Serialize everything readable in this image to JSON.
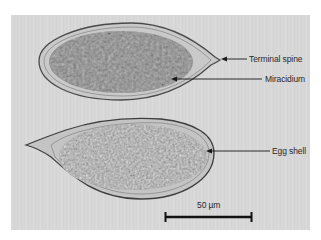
{
  "figure": {
    "annotations": [
      {
        "id": "terminal_spine",
        "label": "Terminal spine"
      },
      {
        "id": "miracidium",
        "label": "Miracidium"
      },
      {
        "id": "egg_shell",
        "label": "Egg shell"
      }
    ],
    "scale_bar": {
      "label": "50 µm"
    },
    "colors": {
      "background": "#d8d8d8",
      "top_egg_interior": "#8f8f8f",
      "bottom_egg_interior": "#a6a6a6",
      "shell_outline": "#4a4a4a",
      "annotation": "#1a1a1a"
    }
  }
}
